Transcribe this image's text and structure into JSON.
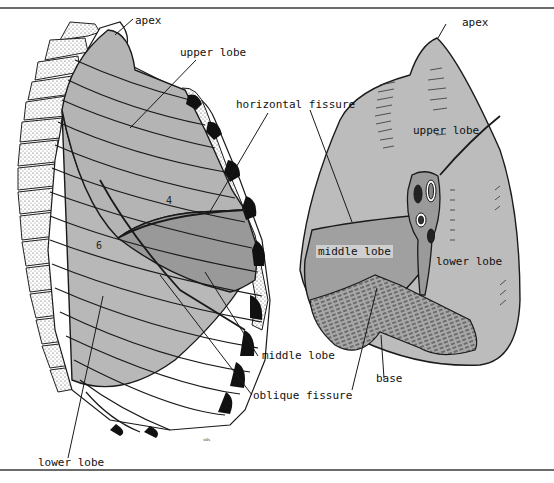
{
  "figure": {
    "left_view": {
      "labels": {
        "apex": "apex",
        "upper_lobe": "upper lobe",
        "horizontal_fissure": "horizontal fissure",
        "middle_lobe": "middle lobe",
        "oblique_fissure": "oblique fissure",
        "lower_lobe": "lower lobe",
        "rib_4": "4",
        "rib_6": "6"
      }
    },
    "right_view": {
      "labels": {
        "apex": "apex",
        "upper_lobe": "upper lobe",
        "middle_lobe": "middle lobe",
        "lower_lobe": "lower lobe",
        "base": "base"
      }
    },
    "signature": "vds",
    "colors": {
      "lobe_light": "#bdbdbd",
      "lobe_mid": "#a3a3a3",
      "lobe_dark": "#8f8f8f",
      "outline": "#1a1a1a",
      "cartilage": "#111111"
    }
  }
}
